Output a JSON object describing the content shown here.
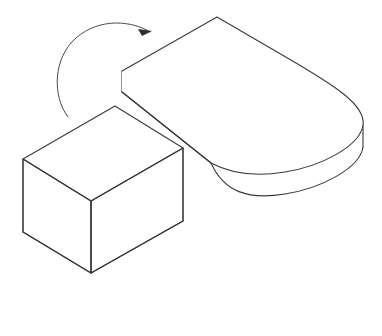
{
  "figure": {
    "title": "Rotation of a rectangular block onto a rounded slab",
    "type": "line-drawing",
    "background_color": "#ffffff",
    "stroke_color": "#3a3a3a",
    "fill_color": "#ffffff",
    "canvas": {
      "width": 382,
      "height": 336
    },
    "objects": [
      {
        "name": "rounded-slab",
        "label": "Rounded rectangular slab (stadium-shaped plate) in isometric view",
        "thickness_px": 21,
        "top_face_path": "M 122 71 L 217 17 L 295 63 C 332 84 366 104 363 125 C 360 146 322 165 285 171 C 248 177 224 170 212 163 L 122 92 Z",
        "top_outline_path": "M 122 71 L 217 17 L 296 63 C 333 85 366 105 363 125 C 360 146 322 166 285 172 C 248 178 224 170 211 163 L 122 92",
        "left_vertical_edge": "M 122 71 L 122 92",
        "right_vertical_edge": "M 363 125 L 363 147",
        "bottom_curve_path": "M 211 163 C 224 192 248 200 285 194 C 322 188 360 168 363 147",
        "front_long_edge": "M 122 92 L 211 163"
      },
      {
        "name": "rectangular-box",
        "label": "Rectangular box (cuboid) in isometric view",
        "height_px": 73,
        "top_face_path": "M 115 106 L 183 148 L 91 201 L 23 159 Z",
        "left_face_path": "M 23 159 L 91 201 L 91 273 L 23 232 Z",
        "right_face_path": "M 91 201 L 183 148 L 183 221 L 91 273 Z",
        "vertical_edges": [
          "M 23 159 L 23 232",
          "M 91 201 L 91 273",
          "M 183 148 L 183 221"
        ],
        "bottom_edges": [
          "M 23 232 L 91 273",
          "M 91 273 L 183 221"
        ]
      },
      {
        "name": "rotation-arrow",
        "label": "Curved rotation arrow indicating the box flips up onto the slab",
        "arc_path": "M 68 117 C 52 96 53 58 76 38 C 100 17 133 21 150 32",
        "arrowhead_points": "152,31 138,29 142,36",
        "direction": "clockwise",
        "tip": {
          "x": 152,
          "y": 31
        }
      }
    ]
  },
  "chart_data": {
    "type": "diagram",
    "title": "Rotation of a rectangular block onto a rounded slab",
    "elements": [
      {
        "name": "rectangular-box",
        "shape": "cuboid",
        "position": "lower-left"
      },
      {
        "name": "rounded-slab",
        "shape": "stadium-prism",
        "position": "upper-right"
      },
      {
        "name": "rotation-arrow",
        "shape": "curved-arrow",
        "position": "upper-left"
      }
    ],
    "legend": [],
    "xlabel": "",
    "ylabel": ""
  }
}
